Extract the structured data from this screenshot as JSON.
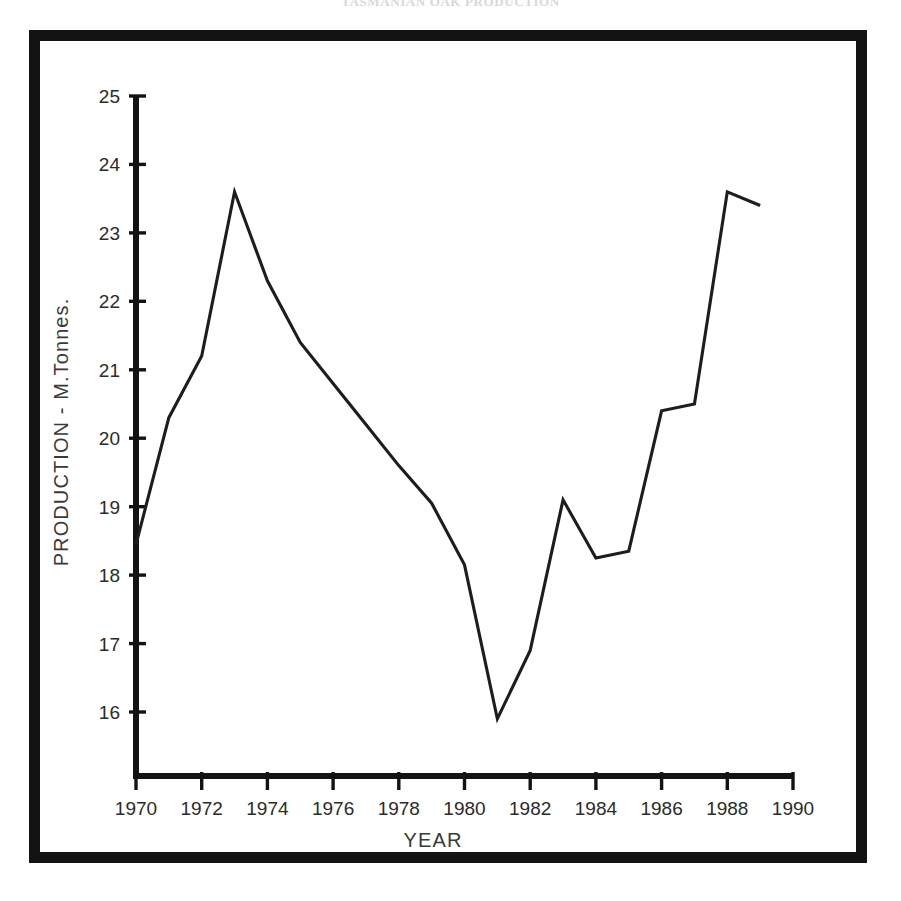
{
  "page": {
    "top_caption": "TASMANIAN  OAK  PRODUCTION"
  },
  "colors": {
    "frame": "#131313",
    "axis": "#131313",
    "line": "#1d1d1d",
    "text": "#2b2b2b",
    "background": "#ffffff"
  },
  "axes": {
    "y_title": "PRODUCTION - M.Tonnes.",
    "x_title": "YEAR",
    "y_ticks": [
      "16",
      "17",
      "18",
      "19",
      "20",
      "21",
      "22",
      "23",
      "24",
      "25"
    ],
    "x_ticks": [
      "1970",
      "1972",
      "1974",
      "1976",
      "1978",
      "1980",
      "1982",
      "1984",
      "1986",
      "1988",
      "1990"
    ]
  },
  "chart_data": {
    "type": "line",
    "title": "TASMANIAN  OAK  PRODUCTION",
    "xlabel": "YEAR",
    "ylabel": "PRODUCTION - M.Tonnes.",
    "xlim": [
      1970,
      1990
    ],
    "ylim": [
      15.2,
      25
    ],
    "y_axis_break": true,
    "grid": false,
    "legend": "none",
    "x_tick_step": 2,
    "y_tick_step": 1,
    "x": [
      1970,
      1971,
      1972,
      1973,
      1974,
      1975,
      1976,
      1977,
      1978,
      1979,
      1980,
      1981,
      1982,
      1983,
      1984,
      1985,
      1986,
      1987,
      1988,
      1989
    ],
    "values": [
      18.45,
      20.3,
      21.2,
      23.6,
      22.3,
      21.4,
      20.8,
      20.2,
      19.6,
      19.05,
      18.15,
      15.9,
      16.9,
      19.1,
      18.25,
      18.35,
      20.4,
      20.5,
      23.6,
      23.4
    ],
    "series": [
      {
        "name": "Production",
        "values": [
          18.45,
          20.3,
          21.2,
          23.6,
          22.3,
          21.4,
          20.8,
          20.2,
          19.6,
          19.05,
          18.15,
          15.9,
          16.9,
          19.1,
          18.25,
          18.35,
          20.4,
          20.5,
          23.6,
          23.4
        ]
      }
    ],
    "annotations": []
  }
}
